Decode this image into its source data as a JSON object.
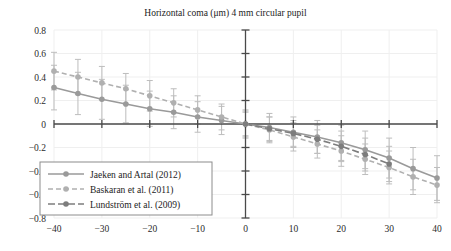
{
  "chart_data": {
    "type": "line",
    "title": "Horizontal coma (μm) 4 mm circular pupil",
    "xlabel": "",
    "ylabel": "",
    "xlim": [
      -40,
      40
    ],
    "ylim": [
      -0.8,
      0.8
    ],
    "xticks": [
      -40,
      -30,
      -20,
      -10,
      0,
      10,
      20,
      30,
      40
    ],
    "xtick_labels": [
      "−40",
      "−30",
      "−20",
      "−10",
      "0",
      "10",
      "20",
      "30",
      "40"
    ],
    "yticks": [
      0.8,
      0.6,
      0.4,
      0.2,
      0,
      -0.2,
      -0.4,
      -0.6,
      -0.8
    ],
    "ytick_labels": [
      "0.8",
      "0.6",
      "0.4",
      "0.2",
      "0",
      "−0.2",
      "−0.4",
      "−0.6",
      "−0.8"
    ],
    "grid": true,
    "legend_position": "lower-left",
    "error_bars": true,
    "series": [
      {
        "name": "Jaeken and Artal (2012)",
        "style": "solid",
        "color": "#9a9a9a",
        "marker": "circle",
        "x": [
          -40,
          -35,
          -30,
          -25,
          -20,
          -15,
          -10,
          -5,
          0,
          5,
          10,
          15,
          20,
          25,
          30,
          35,
          40
        ],
        "y": [
          0.31,
          0.26,
          0.21,
          0.17,
          0.13,
          0.1,
          0.06,
          0.03,
          0.0,
          -0.03,
          -0.07,
          -0.11,
          -0.16,
          -0.22,
          -0.29,
          -0.38,
          -0.46
        ],
        "yerr": [
          0.19,
          0.18,
          0.17,
          0.16,
          0.15,
          0.14,
          0.13,
          0.12,
          0.12,
          0.12,
          0.13,
          0.14,
          0.15,
          0.16,
          0.17,
          0.18,
          0.19
        ]
      },
      {
        "name": "Baskaran et al. (2011)",
        "style": "dashed",
        "color": "#b0b0b0",
        "marker": "circle",
        "x": [
          -40,
          -35,
          -30,
          -25,
          -20,
          -15,
          -10,
          -5,
          0,
          5,
          10,
          15,
          20,
          25,
          30,
          35,
          40
        ],
        "y": [
          0.45,
          0.4,
          0.35,
          0.3,
          0.24,
          0.18,
          0.12,
          0.06,
          0.0,
          -0.05,
          -0.11,
          -0.17,
          -0.23,
          -0.3,
          -0.37,
          -0.45,
          -0.52
        ],
        "yerr": [
          0.16,
          0.15,
          0.14,
          0.13,
          0.13,
          0.12,
          0.12,
          0.11,
          0.11,
          0.11,
          0.12,
          0.12,
          0.13,
          0.13,
          0.14,
          0.15,
          0.15
        ]
      },
      {
        "name": "Lundström et al. (2009)",
        "style": "dashdot",
        "color": "#7d7d7d",
        "marker": "circle",
        "x": [
          0,
          5,
          10,
          15,
          20,
          25,
          30
        ],
        "y": [
          0.0,
          -0.04,
          -0.08,
          -0.13,
          -0.19,
          -0.26,
          -0.34
        ],
        "yerr": [
          0.1,
          0.1,
          0.11,
          0.12,
          0.13,
          0.14,
          0.15
        ]
      }
    ]
  },
  "legend": {
    "items": [
      {
        "label": "Jaeken and Artal (2012)"
      },
      {
        "label": "Baskaran et al. (2011)"
      },
      {
        "label": "Lundström et al. (2009)"
      }
    ]
  },
  "colors": {
    "axis": "#4a4a4a",
    "grid": "#efefef",
    "error_bar": "#bdbdbd",
    "legend_border": "#8c8c8c",
    "text": "#1c1c1c"
  }
}
